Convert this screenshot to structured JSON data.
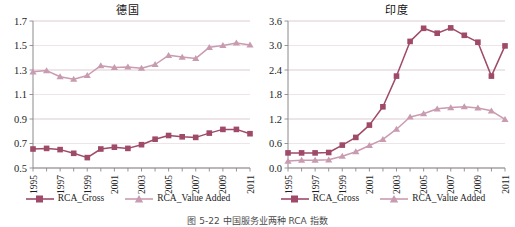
{
  "figure": {
    "caption": "图 5-22  中国服务业两种 RCA 指数",
    "series_colors": {
      "rca_gross": "#9e4a68",
      "rca_value_added": "#c99bb0",
      "gridline": "#d9c3cb",
      "axis": "#8a8a8a"
    }
  },
  "legend": {
    "entries": [
      {
        "label": "RCA_Gross",
        "marker": "square",
        "color": "#9e4a68"
      },
      {
        "label": "RCA_Value Added",
        "marker": "triangle",
        "color": "#c99bb0"
      }
    ]
  },
  "chart_data": [
    {
      "type": "line",
      "title": "德国",
      "xlabel": "",
      "ylabel": "",
      "grid": true,
      "legend_position": "bottom",
      "xlim": [
        1995,
        2011
      ],
      "ylim": [
        0.5,
        1.7
      ],
      "yticks": [
        "0.5",
        "0.7",
        "0.9",
        "1.1",
        "1.3",
        "1.5",
        "1.7"
      ],
      "x": [
        1995,
        1996,
        1997,
        1998,
        1999,
        2000,
        2001,
        2002,
        2003,
        2004,
        2005,
        2006,
        2007,
        2008,
        2009,
        2010,
        2011
      ],
      "xticklabels": [
        "1995",
        "",
        "1997",
        "",
        "1999",
        "",
        "2001",
        "",
        "2003",
        "",
        "2005",
        "",
        "2007",
        "",
        "2009",
        "",
        "2011"
      ],
      "series": [
        {
          "name": "RCA_Gross",
          "marker": "square",
          "color": "#9e4a68",
          "values": [
            0.655,
            0.66,
            0.65,
            0.62,
            0.585,
            0.655,
            0.67,
            0.66,
            0.69,
            0.735,
            0.765,
            0.755,
            0.75,
            0.785,
            0.815,
            0.815,
            0.78
          ]
        },
        {
          "name": "RCA_Value Added",
          "marker": "triangle",
          "color": "#c99bb0",
          "values": [
            1.285,
            1.295,
            1.245,
            1.225,
            1.255,
            1.335,
            1.32,
            1.325,
            1.315,
            1.345,
            1.42,
            1.405,
            1.395,
            1.485,
            1.5,
            1.52,
            1.505
          ]
        }
      ]
    },
    {
      "type": "line",
      "title": "印度",
      "xlabel": "",
      "ylabel": "",
      "grid": true,
      "legend_position": "bottom",
      "xlim": [
        1995,
        2011
      ],
      "ylim": [
        0.0,
        3.6
      ],
      "yticks": [
        "0.0",
        "0.6",
        "1.2",
        "1.8",
        "2.4",
        "3.0",
        "3.6"
      ],
      "x": [
        1995,
        1996,
        1997,
        1998,
        1999,
        2000,
        2001,
        2002,
        2003,
        2004,
        2005,
        2006,
        2007,
        2008,
        2009,
        2010,
        2011
      ],
      "xticklabels": [
        "1995",
        "",
        "1997",
        "",
        "1999",
        "",
        "2001",
        "",
        "2003",
        "",
        "2005",
        "",
        "2007",
        "",
        "2009",
        "",
        "2011"
      ],
      "series": [
        {
          "name": "RCA_Gross",
          "marker": "square",
          "color": "#9e4a68",
          "values": [
            0.37,
            0.37,
            0.37,
            0.38,
            0.56,
            0.75,
            1.05,
            1.5,
            2.25,
            3.1,
            3.42,
            3.3,
            3.43,
            3.25,
            3.08,
            2.25,
            2.99,
            2.85
          ]
        },
        {
          "name": "RCA_Value Added",
          "marker": "triangle",
          "color": "#c99bb0",
          "values": [
            0.17,
            0.19,
            0.19,
            0.2,
            0.29,
            0.4,
            0.55,
            0.7,
            0.95,
            1.25,
            1.33,
            1.45,
            1.48,
            1.5,
            1.47,
            1.4,
            1.19,
            1.45,
            1.38
          ]
        }
      ]
    }
  ]
}
